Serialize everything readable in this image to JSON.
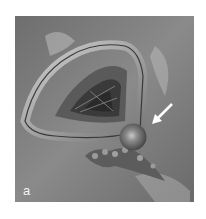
{
  "figure": {
    "panel_label": "a",
    "colors": {
      "background": "#7c7c7c",
      "arrow": "#ffffff",
      "label": "#f2f2f2"
    }
  }
}
